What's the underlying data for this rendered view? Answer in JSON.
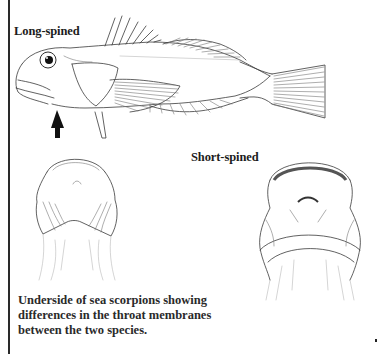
{
  "figure": {
    "labels": {
      "long_spined": "Long-spined",
      "short_spined": "Short-spined"
    },
    "caption": {
      "lines": [
        "Underside of sea scorpions showing",
        "differences in the throat membranes",
        "between the two species."
      ]
    },
    "illustrations": [
      {
        "id": "side-view-fish",
        "description": "Long-spined sea scorpion, lateral view",
        "pointer": "black arrow pointing up at throat"
      },
      {
        "id": "underside-long-spined",
        "description": "Underside of long-spined sea scorpion head"
      },
      {
        "id": "underside-short-spined",
        "description": "Underside of short-spined sea scorpion head"
      }
    ],
    "colors": {
      "ink": "#3a3a3a",
      "text": "#1c1c1c",
      "background": "#ffffff"
    }
  }
}
